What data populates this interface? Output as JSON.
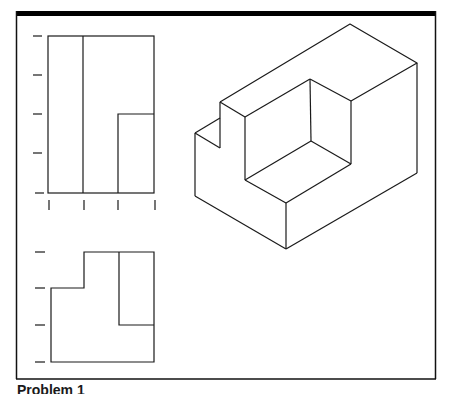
{
  "figure": {
    "caption": "Problem 1",
    "colors": {
      "line": "#1a1a1a",
      "frame": "#111111",
      "background": "#ffffff"
    },
    "views": [
      {
        "name": "top-view",
        "label": ""
      },
      {
        "name": "front-view",
        "label": ""
      },
      {
        "name": "isometric-view",
        "label": ""
      }
    ],
    "grid_ticks": {
      "top_view_left_ticks": 5,
      "top_view_bottom_ticks": 4,
      "front_view_left_ticks": 4
    }
  }
}
